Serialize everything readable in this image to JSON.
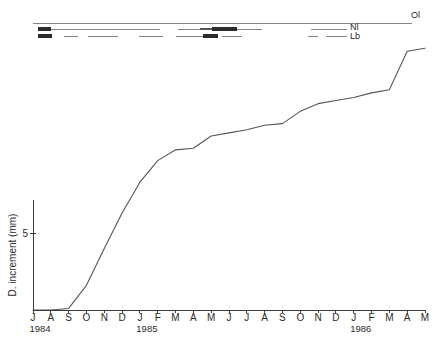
{
  "chart_data": {
    "type": "line",
    "title": "",
    "subtitle": "",
    "xlabel": "",
    "ylabel": "D. increment (mm)",
    "grid": false,
    "legend_position": "none",
    "xlim": [
      "1984-07",
      "1986-05"
    ],
    "ylim": [
      0,
      17.5
    ],
    "ytick_values": [
      5
    ],
    "ytick_labels": [
      "5"
    ],
    "xtick_labels": [
      "J",
      "A",
      "S",
      "O",
      "N",
      "D",
      "J",
      "F",
      "M",
      "A",
      "M",
      "J",
      "J",
      "A",
      "S",
      "O",
      "N",
      "D",
      "J",
      "F",
      "M",
      "A",
      "M"
    ],
    "year_labels": [
      {
        "text": "1984",
        "at_tick_index": 0
      },
      {
        "text": "1985",
        "at_tick_index": 6
      },
      {
        "text": "1986",
        "at_tick_index": 18
      }
    ],
    "series": [
      {
        "name": "D. increment",
        "x": [
          "J 1984",
          "A 1984",
          "S 1984",
          "O 1984",
          "N 1984",
          "D 1984",
          "J 1985",
          "F 1985",
          "M 1985",
          "A 1985",
          "M 1985",
          "J 1985",
          "J 1985",
          "A 1985",
          "S 1985",
          "O 1985",
          "N 1985",
          "D 1985",
          "J 1986",
          "F 1986",
          "M 1986",
          "A 1986",
          "M 1986"
        ],
        "values": [
          0.0,
          0.0,
          0.1,
          1.6,
          4.0,
          6.3,
          8.3,
          9.7,
          10.4,
          10.5,
          11.3,
          11.5,
          11.7,
          12.0,
          12.1,
          12.9,
          13.4,
          13.6,
          13.8,
          14.1,
          14.3,
          16.8,
          17.0
        ]
      }
    ],
    "annotations": {
      "rows": [
        {
          "label": "Ol",
          "label_x": 411,
          "label_y": 18,
          "y": 23,
          "segments": [
            {
              "x1": 33,
              "x2": 412,
              "weight": "thin"
            }
          ]
        },
        {
          "label": "Nl",
          "label_x": 350,
          "label_y": 30,
          "y": 29,
          "segments": [
            {
              "x1": 38,
              "x2": 51,
              "weight": "thick"
            },
            {
              "x1": 51,
              "x2": 160,
              "weight": "thin"
            },
            {
              "x1": 178,
              "x2": 200,
              "weight": "thin"
            },
            {
              "x1": 200,
              "x2": 212,
              "weight": "med"
            },
            {
              "x1": 212,
              "x2": 237,
              "weight": "thick"
            },
            {
              "x1": 237,
              "x2": 262,
              "weight": "thin"
            },
            {
              "x1": 311,
              "x2": 347,
              "weight": "thin"
            }
          ]
        },
        {
          "label": "Lb",
          "label_x": 350,
          "label_y": 39,
          "y": 36,
          "segments": [
            {
              "x1": 38,
              "x2": 52,
              "weight": "thick"
            },
            {
              "x1": 64,
              "x2": 78,
              "weight": "thin"
            },
            {
              "x1": 88,
              "x2": 118,
              "weight": "thin"
            },
            {
              "x1": 139,
              "x2": 163,
              "weight": "thin"
            },
            {
              "x1": 176,
              "x2": 203,
              "weight": "thin"
            },
            {
              "x1": 203,
              "x2": 218,
              "weight": "thick"
            },
            {
              "x1": 222,
              "x2": 242,
              "weight": "thin"
            },
            {
              "x1": 308,
              "x2": 318,
              "weight": "thin"
            },
            {
              "x1": 326,
              "x2": 347,
              "weight": "thin"
            }
          ]
        }
      ]
    },
    "geometry": {
      "plot_left": 33,
      "plot_right": 425,
      "x_axis_y": 310,
      "y_axis_top": 200,
      "y_axis_bottom": 310,
      "y_value_at_axis_top": 6.9,
      "y_tick5_py": 233,
      "month_label_y": 321,
      "year_label_y": 332
    },
    "colors": {
      "curve": "#555555",
      "axis": "#3a3a3a",
      "event_thin": "#777777",
      "event_thick": "#2b2b2b",
      "background": "#ffffff"
    }
  }
}
